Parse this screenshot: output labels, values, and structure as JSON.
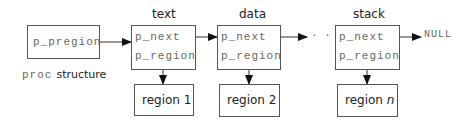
{
  "proc": {
    "field": "p_pregion",
    "caption_mono": "proc",
    "caption_sans": "structure"
  },
  "regions": [
    {
      "title": "text",
      "next": "p_next",
      "region": "p_region",
      "target": "region 1"
    },
    {
      "title": "data",
      "next": "p_next",
      "region": "p_region",
      "target": "region 2"
    },
    {
      "title": "stack",
      "next": "p_next",
      "region": "p_region",
      "target_prefix": "region ",
      "target_var": "n"
    }
  ],
  "ellipsis": "· · ·",
  "terminator": "NULL"
}
